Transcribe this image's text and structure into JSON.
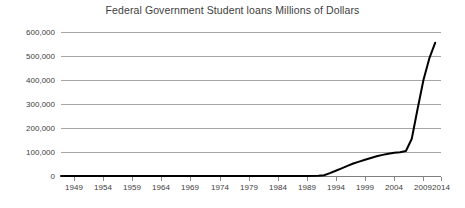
{
  "chart_data": {
    "type": "line",
    "title": "Federal Government Student loans Millions of Dollars",
    "xlabel": "",
    "ylabel": "",
    "xlim": [
      1949,
      2014
    ],
    "ylim": [
      0,
      600000
    ],
    "grid": true,
    "legend": false,
    "legend_position": "none",
    "line_color": "#000000",
    "grid_color": "#a6a6a6",
    "axis_color": "#7f7f7f",
    "text_color": "#3d3d3d",
    "background_color": "#ffffff",
    "y_ticks": [
      "600,000",
      "500,000",
      "400,000",
      "300,000",
      "200,000",
      "100,000",
      "0"
    ],
    "y_tick_values": [
      600000,
      500000,
      400000,
      300000,
      200000,
      100000,
      0
    ],
    "x_ticks": [
      "1949",
      "1954",
      "1959",
      "1964",
      "1969",
      "1974",
      "1979",
      "1984",
      "1989",
      "1994",
      "1999",
      "2004",
      "2009",
      "2014"
    ],
    "x_tick_values": [
      1949,
      1954,
      1959,
      1964,
      1969,
      1974,
      1979,
      1984,
      1989,
      1994,
      1999,
      2004,
      2009,
      2014
    ],
    "series": [
      {
        "name": "Federal Government Student loans",
        "x": [
          1949,
          1954,
          1959,
          1964,
          1969,
          1974,
          1979,
          1984,
          1989,
          1991,
          1993,
          1994,
          1995,
          1996,
          1997,
          1998,
          1999,
          2000,
          2001,
          2002,
          2003,
          2004,
          2005,
          2006,
          2007,
          2008,
          2009,
          2010,
          2011,
          2012,
          2013
        ],
        "values": [
          0,
          0,
          0,
          0,
          0,
          0,
          0,
          0,
          0,
          0,
          1000,
          3000,
          12000,
          22000,
          32000,
          42000,
          52000,
          60000,
          68000,
          75000,
          82000,
          88000,
          93000,
          97000,
          99000,
          104000,
          155000,
          280000,
          400000,
          490000,
          555000
        ]
      }
    ]
  }
}
